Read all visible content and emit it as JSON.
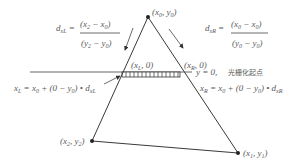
{
  "diagram": {
    "colors": {
      "line": "#3a3a3a",
      "text": "#5a5a5a",
      "scanline": "#555555",
      "pixel_fill": "#ffffff",
      "pixel_stroke": "#333333"
    },
    "vertices": {
      "top": {
        "label_x": "x",
        "label_sub_x": "0",
        "label_y": "y",
        "label_sub_y": "0",
        "px": 148,
        "py": 17
      },
      "left": {
        "label_x": "x",
        "label_sub_x": "2",
        "label_y": "y",
        "label_sub_y": "2",
        "px": 92,
        "py": 141
      },
      "right": {
        "label_x": "x",
        "label_sub_x": "1",
        "label_y": "y",
        "label_sub_y": "1",
        "px": 238,
        "py": 153
      }
    },
    "intersections": {
      "left": {
        "label": "(x",
        "sub": "L",
        "tail": ", 0)"
      },
      "right": {
        "label": "(x",
        "sub": "R",
        "tail": ", 0)"
      }
    },
    "scanline": {
      "label": "y = 0,",
      "label_cjk": "光栅化起点"
    },
    "formulas": {
      "dxL": {
        "lhs": "d",
        "lhs_sub": "xL",
        "num": "(x",
        "num_sub1": "2",
        "num_mid": " − x",
        "num_sub2": "0",
        "num_end": ")",
        "den": "(y",
        "den_sub1": "2",
        "den_mid": " − y",
        "den_sub2": "0",
        "den_end": ")"
      },
      "dxR": {
        "lhs": "d",
        "lhs_sub": "xR",
        "num": "(x",
        "num_sub1": "0",
        "num_mid": " − x",
        "num_sub2": "0",
        "num_end": ")",
        "den": "(y",
        "den_sub1": "0",
        "den_mid": " − y",
        "den_sub2": "0",
        "den_end": ")"
      },
      "xL": {
        "lhs": "x",
        "lhs_sub": "L",
        "rhs1": " = x",
        "rhs1_sub": "0",
        "rhs2": " + (0 − y",
        "rhs2_sub": "0",
        "rhs3": ") • d",
        "rhs3_sub": "xL"
      },
      "xR": {
        "lhs": "x",
        "lhs_sub": "R",
        "rhs1": " = x",
        "rhs1_sub": "0",
        "rhs2": " + (0 − y",
        "rhs2_sub": "0",
        "rhs3": ") • d",
        "rhs3_sub": "xR"
      }
    }
  }
}
